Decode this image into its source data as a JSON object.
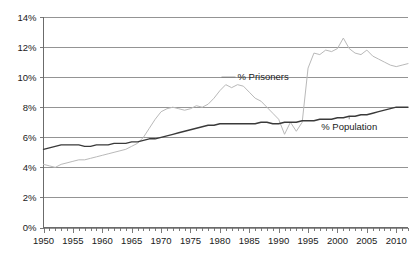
{
  "chart_data": {
    "type": "line",
    "title": "",
    "subtitle": "",
    "xlabel": "",
    "ylabel": "",
    "xlim": [
      1950,
      2012
    ],
    "ylim": [
      0,
      14
    ],
    "grid": true,
    "legend_position": "inline-annotations",
    "y_ticks": [
      "0%",
      "2%",
      "4%",
      "6%",
      "8%",
      "10%",
      "12%",
      "14%"
    ],
    "y_tick_values": [
      0,
      2,
      4,
      6,
      8,
      10,
      12,
      14
    ],
    "x_ticks": [
      "1950",
      "1955",
      "1960",
      "1965",
      "1970",
      "1975",
      "1980",
      "1985",
      "1990",
      "1995",
      "2000",
      "2005",
      "2010"
    ],
    "x_tick_values": [
      1950,
      1955,
      1960,
      1965,
      1970,
      1975,
      1980,
      1985,
      1990,
      1995,
      2000,
      2005,
      2010
    ],
    "x_minor_step": 1,
    "annotations": [
      {
        "name": "prisoners-label",
        "text": "% Prisoners",
        "x": 1983,
        "y": 9.8
      },
      {
        "name": "population-label",
        "text": "% Population",
        "x": 2002,
        "y": 6.6
      }
    ],
    "series": [
      {
        "name": "% Prisoners",
        "color": "#b9b9b9",
        "x": [
          1950,
          1951,
          1952,
          1953,
          1954,
          1955,
          1956,
          1957,
          1958,
          1959,
          1960,
          1961,
          1962,
          1963,
          1964,
          1965,
          1966,
          1967,
          1968,
          1969,
          1970,
          1971,
          1972,
          1973,
          1974,
          1975,
          1976,
          1977,
          1978,
          1979,
          1980,
          1981,
          1982,
          1983,
          1984,
          1985,
          1986,
          1987,
          1988,
          1989,
          1990,
          1991,
          1992,
          1993,
          1994,
          1995,
          1996,
          1997,
          1998,
          1999,
          2000,
          2001,
          2002,
          2003,
          2004,
          2005,
          2006,
          2007,
          2008,
          2009,
          2010,
          2011,
          2012
        ],
        "values": [
          4.2,
          4.1,
          4.0,
          4.2,
          4.3,
          4.4,
          4.5,
          4.5,
          4.6,
          4.7,
          4.8,
          4.9,
          5.0,
          5.1,
          5.2,
          5.4,
          5.6,
          6.0,
          6.6,
          7.2,
          7.7,
          7.9,
          8.0,
          7.9,
          7.8,
          7.9,
          8.1,
          8.0,
          8.2,
          8.6,
          9.1,
          9.5,
          9.3,
          9.5,
          9.4,
          9.0,
          8.6,
          8.4,
          8.0,
          7.6,
          7.2,
          6.2,
          7.0,
          6.4,
          7.0,
          10.6,
          11.6,
          11.5,
          11.8,
          11.7,
          11.9,
          12.6,
          11.9,
          11.6,
          11.5,
          11.8,
          11.4,
          11.2,
          11.0,
          10.8,
          10.7,
          10.8,
          10.9
        ]
      },
      {
        "name": "% Population",
        "color": "#3a3a3a",
        "x": [
          1950,
          1951,
          1952,
          1953,
          1954,
          1955,
          1956,
          1957,
          1958,
          1959,
          1960,
          1961,
          1962,
          1963,
          1964,
          1965,
          1966,
          1967,
          1968,
          1969,
          1970,
          1971,
          1972,
          1973,
          1974,
          1975,
          1976,
          1977,
          1978,
          1979,
          1980,
          1981,
          1982,
          1983,
          1984,
          1985,
          1986,
          1987,
          1988,
          1989,
          1990,
          1991,
          1992,
          1993,
          1994,
          1995,
          1996,
          1997,
          1998,
          1999,
          2000,
          2001,
          2002,
          2003,
          2004,
          2005,
          2006,
          2007,
          2008,
          2009,
          2010,
          2011,
          2012
        ],
        "values": [
          5.2,
          5.3,
          5.4,
          5.5,
          5.5,
          5.5,
          5.5,
          5.4,
          5.4,
          5.5,
          5.5,
          5.5,
          5.6,
          5.6,
          5.6,
          5.7,
          5.7,
          5.8,
          5.9,
          5.9,
          6.0,
          6.1,
          6.2,
          6.3,
          6.4,
          6.5,
          6.6,
          6.7,
          6.8,
          6.8,
          6.9,
          6.9,
          6.9,
          6.9,
          6.9,
          6.9,
          6.9,
          7.0,
          7.0,
          6.9,
          6.9,
          7.0,
          7.0,
          7.0,
          7.1,
          7.1,
          7.1,
          7.2,
          7.2,
          7.2,
          7.3,
          7.3,
          7.4,
          7.4,
          7.5,
          7.5,
          7.6,
          7.7,
          7.8,
          7.9,
          8.0,
          8.0,
          8.0
        ]
      }
    ]
  },
  "axes": {
    "y_axis_name": "percent-axis",
    "x_axis_name": "year-axis"
  }
}
